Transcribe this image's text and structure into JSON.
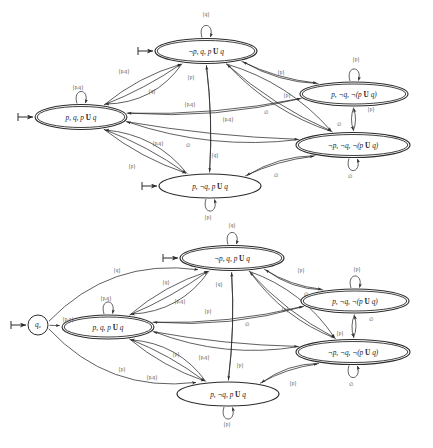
{
  "figure": {
    "title_fragment": "",
    "width": 433,
    "height": 448,
    "background": "#ffffff",
    "ink_color": "#2b2b2b",
    "label_color": "#4a4a4a"
  },
  "symbols": {
    "until": "U",
    "neg": "¬",
    "empty_set": "∅",
    "set_open": "{",
    "set_close": "}"
  },
  "diagrams": [
    {
      "id": "top-automaton",
      "name": "generalized-buchi-automaton-without-initial-state",
      "has_initial_node": false,
      "nodes": [
        {
          "id": "n_npq",
          "name": "state-not-p-q-until",
          "label": "¬p, q, p U q",
          "accepting": true,
          "initial_marker": true,
          "cx": 206,
          "cy": 51,
          "rx": 51,
          "ry": 12.5
        },
        {
          "id": "n_pq",
          "name": "state-p-q-until",
          "label": "p, q, p U q",
          "accepting": true,
          "initial_marker": true,
          "cx": 81,
          "cy": 117,
          "rx": 46,
          "ry": 12.5
        },
        {
          "id": "n_pnq_not",
          "name": "state-p-not-q-not-until",
          "label": "p, ¬q, ¬(p U q)",
          "accepting": true,
          "initial_marker": false,
          "cx": 354,
          "cy": 94,
          "rx": 54,
          "ry": 12.0
        },
        {
          "id": "n_npnq_not",
          "name": "state-not-p-not-q-not-until",
          "label": "¬p, ¬q, ¬(p U q)",
          "accepting": true,
          "initial_marker": false,
          "cx": 353,
          "cy": 145,
          "rx": 57,
          "ry": 12.5
        },
        {
          "id": "n_pnq",
          "name": "state-p-not-q-until",
          "label": "p, ¬q, p U q",
          "accepting": false,
          "initial_marker": true,
          "cx": 210,
          "cy": 186,
          "rx": 51,
          "ry": 12.0
        }
      ],
      "edge_labels": [
        {
          "name": "loop-label-top",
          "text": "{q}",
          "x": 206,
          "y": 15
        },
        {
          "name": "loop-label-left",
          "text": "{p,q}",
          "x": 78,
          "y": 88
        },
        {
          "name": "loop-label-right-upper",
          "text": "{p}",
          "x": 356,
          "y": 60
        },
        {
          "name": "loop-label-right-lower",
          "text": "∅",
          "x": 350,
          "y": 177
        },
        {
          "name": "loop-label-bottom",
          "text": "{p}",
          "x": 208,
          "y": 218
        },
        {
          "name": "edge-label-pq-to-npq-a",
          "text": "{p,q}",
          "x": 124,
          "y": 72
        },
        {
          "name": "edge-label-pq-to-npq-b",
          "text": "{q}",
          "x": 152,
          "y": 92
        },
        {
          "name": "edge-label-npq-vertical",
          "text": "{p}",
          "x": 191,
          "y": 78
        },
        {
          "name": "edge-label-npq-vertical-lower",
          "text": "{q}",
          "x": 215,
          "y": 156
        },
        {
          "name": "edge-label-npq-to-pnqnot",
          "text": "{p}",
          "x": 281,
          "y": 73
        },
        {
          "name": "edge-label-npq-to-npnqnot",
          "text": "{p}",
          "x": 287,
          "y": 96
        },
        {
          "name": "edge-label-npq-to-empty",
          "text": "∅",
          "x": 266,
          "y": 113
        },
        {
          "name": "edge-label-pq-to-right-a",
          "text": "{p,q}",
          "x": 190,
          "y": 105
        },
        {
          "name": "edge-label-pq-to-right-b",
          "text": "{p,q}",
          "x": 228,
          "y": 120
        },
        {
          "name": "edge-label-pq-to-pnq",
          "text": "{p,q}",
          "x": 158,
          "y": 144
        },
        {
          "name": "edge-label-pq-empty",
          "text": "∅",
          "x": 188,
          "y": 146
        },
        {
          "name": "edge-label-pq-to-pnq-b",
          "text": "{p}",
          "x": 132,
          "y": 167
        },
        {
          "name": "edge-label-right-pair-p",
          "text": "{p}",
          "x": 371,
          "y": 110
        },
        {
          "name": "edge-label-right-pair-empty",
          "text": "∅",
          "x": 339,
          "y": 125
        },
        {
          "name": "edge-label-npnqnot-to-pnq",
          "text": "∅",
          "x": 276,
          "y": 176
        }
      ]
    },
    {
      "id": "bottom-automaton",
      "name": "generalized-buchi-automaton-with-initial-state",
      "has_initial_node": true,
      "initial_node": {
        "id": "q0",
        "name": "initial-state-q0",
        "label": "q₀",
        "cx": 38,
        "cy": 325,
        "r": 10
      },
      "nodes": [
        {
          "id": "b_npq",
          "name": "state-not-p-q-until",
          "label": "¬p, q, p U q",
          "accepting": true,
          "initial_marker": true,
          "cx": 232,
          "cy": 258,
          "rx": 52,
          "ry": 12.5
        },
        {
          "id": "b_pq",
          "name": "state-p-q-until",
          "label": "p, q, p U q",
          "accepting": true,
          "initial_marker": false,
          "cx": 108,
          "cy": 327,
          "rx": 46,
          "ry": 12.0
        },
        {
          "id": "b_pnq_not",
          "name": "state-p-not-q-not-until",
          "label": "p, ¬q, ¬(p U q)",
          "accepting": true,
          "initial_marker": false,
          "cx": 355,
          "cy": 301,
          "rx": 54,
          "ry": 12.0
        },
        {
          "id": "b_npnq_not",
          "name": "state-not-p-not-q-not-until",
          "label": "¬p, ¬q, ¬(p U q)",
          "accepting": true,
          "initial_marker": false,
          "cx": 353,
          "cy": 352,
          "rx": 57,
          "ry": 12.5
        },
        {
          "id": "b_pnq",
          "name": "state-p-not-q-until",
          "label": "p, ¬q, p U q",
          "accepting": false,
          "initial_marker": false,
          "cx": 228,
          "cy": 394,
          "rx": 51,
          "ry": 12.0
        }
      ],
      "edge_labels": [
        {
          "name": "loop-label-top",
          "text": "{q}",
          "x": 232,
          "y": 226
        },
        {
          "name": "loop-label-left",
          "text": "{p,q}",
          "x": 106,
          "y": 299
        },
        {
          "name": "loop-label-right-upper",
          "text": "{p}",
          "x": 357,
          "y": 270
        },
        {
          "name": "loop-label-right-lower",
          "text": "∅",
          "x": 351,
          "y": 385
        },
        {
          "name": "loop-label-bottom",
          "text": "{p}",
          "x": 227,
          "y": 425
        },
        {
          "name": "q0-to-npq",
          "text": "{q}",
          "x": 117,
          "y": 271
        },
        {
          "name": "q0-to-pq",
          "text": "{p,q}",
          "x": 68,
          "y": 320
        },
        {
          "name": "q0-to-pnq",
          "text": "{p}",
          "x": 122,
          "y": 370
        },
        {
          "name": "edge-label-pq-to-npq-a",
          "text": "{q}",
          "x": 166,
          "y": 283
        },
        {
          "name": "edge-label-pq-to-npq-b",
          "text": "{p,q}",
          "x": 180,
          "y": 302
        },
        {
          "name": "edge-label-npq-vertical",
          "text": "{q}",
          "x": 219,
          "y": 285
        },
        {
          "name": "edge-label-npq-vertical-lower",
          "text": "{p}",
          "x": 240,
          "y": 366
        },
        {
          "name": "edge-label-npq-to-pnqnot",
          "text": "{p}",
          "x": 301,
          "y": 271
        },
        {
          "name": "edge-label-npq-to-empty",
          "text": "∅",
          "x": 306,
          "y": 295
        },
        {
          "name": "edge-label-npq-to-npnqnot",
          "text": "{p}",
          "x": 285,
          "y": 310
        },
        {
          "name": "edge-label-pq-to-right-a",
          "text": "{p}",
          "x": 208,
          "y": 312
        },
        {
          "name": "edge-label-pq-to-right-b",
          "text": "∅",
          "x": 247,
          "y": 325
        },
        {
          "name": "edge-label-pq-to-pnq-a",
          "text": "{p}",
          "x": 176,
          "y": 355
        },
        {
          "name": "edge-label-pq-to-pnq-b",
          "text": "{p,q}",
          "x": 204,
          "y": 358
        },
        {
          "name": "edge-label-pq-to-pnq-c",
          "text": "{p,q}",
          "x": 152,
          "y": 378
        },
        {
          "name": "edge-label-right-pair-empty",
          "text": "∅",
          "x": 371,
          "y": 320
        },
        {
          "name": "edge-label-right-pair-p",
          "text": "{p}",
          "x": 340,
          "y": 334
        },
        {
          "name": "edge-label-npnqnot-to-pnq",
          "text": "{p}",
          "x": 293,
          "y": 384
        }
      ]
    }
  ]
}
